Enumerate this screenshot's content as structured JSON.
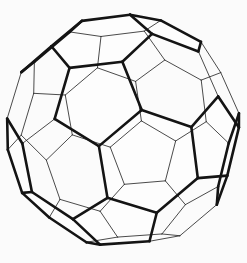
{
  "figure": {
    "alt_text": "Line drawing of a truncated icosahedron (buckyball) shown in perspective with a hexagonal face toward the viewer",
    "shape_name": "truncated-icosahedron",
    "background_color": "#fbfbfb",
    "visible_edge_color": "#141414",
    "hidden_edge_color": "#2b2b2b",
    "face_color": "#fdfdfd",
    "visible_edge_width": 2.6,
    "hidden_edge_width": 0.85,
    "canvas_width": 247,
    "canvas_height": 263
  },
  "geometry": {
    "vertex_count": 60,
    "edge_count": 90,
    "face_count": 32,
    "hexagon_face_count": 20,
    "pentagon_face_count": 12,
    "projection": "perspective",
    "camera_distance": 6.2,
    "scale": 117,
    "center_x": 123.5,
    "center_y": 131.5,
    "rotation_x_deg": 8,
    "rotation_y_deg": 4,
    "rotation_z_deg": 0,
    "orientation_note": "hexagonal face toward viewer",
    "silhouette_bounds": {
      "left": 11,
      "right": 235,
      "top": 13,
      "bottom": 247
    }
  }
}
